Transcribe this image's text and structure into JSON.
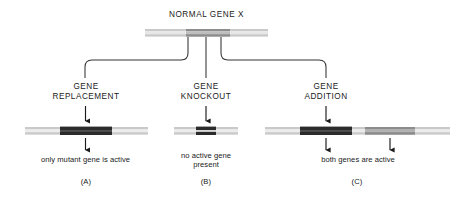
{
  "figure": {
    "title": "NORMAL GENE X",
    "background": "#ffffff",
    "ink": "#1a1a1a"
  },
  "colors": {
    "chromosome_light": "#c9c9c9",
    "chromosome_mid": "#9a9a9a",
    "gene_dark": "#2b2b2b",
    "gene_gray": "#8c8c8c",
    "line": "#333333"
  },
  "top_gene": {
    "label": "NORMAL GENE X",
    "segment_label": "gene X",
    "x_start": 145,
    "x_end": 268,
    "gene_x_start": 186,
    "gene_x_end": 230
  },
  "branches": [
    {
      "id": "A",
      "label": "GENE\nREPLACEMENT",
      "label_line1": "GENE",
      "label_line2": "REPLACEMENT",
      "caption": "only mutant gene is active",
      "panel_id": "(A)",
      "center_x": 86,
      "bar": {
        "x_start": 25,
        "x_end": 148
      },
      "inserts": [
        {
          "name": "mutant-gene",
          "fill": "gene_dark",
          "x_start": 60,
          "x_end": 112
        }
      ],
      "arrows_above": [
        86
      ],
      "arrows_below": [
        86
      ]
    },
    {
      "id": "B",
      "label": "GENE\nKNOCKOUT",
      "label_line1": "GENE",
      "label_line2": "KNOCKOUT",
      "caption": "no active gene\npresent",
      "caption_line1": "no active gene",
      "caption_line2": "present",
      "panel_id": "(B)",
      "center_x": 206,
      "bar": {
        "x_start": 174,
        "x_end": 238
      },
      "inserts": [
        {
          "name": "disrupted-gene",
          "fill": "gene_dark",
          "x_start": 196,
          "x_end": 216
        }
      ],
      "arrows_above": [
        206
      ],
      "arrows_below": []
    },
    {
      "id": "C",
      "label": "GENE\nADDITION",
      "label_line1": "GENE",
      "label_line2": "ADDITION",
      "caption": "both genes are active",
      "panel_id": "(C)",
      "center_x": 358,
      "bar": {
        "x_start": 265,
        "x_end": 450
      },
      "inserts": [
        {
          "name": "added-gene-dark",
          "fill": "gene_dark",
          "x_start": 300,
          "x_end": 352
        },
        {
          "name": "native-gene-gray",
          "fill": "gene_gray",
          "x_start": 365,
          "x_end": 415
        }
      ],
      "arrows_above": [
        326
      ],
      "arrows_below": [
        326,
        390
      ]
    }
  ]
}
